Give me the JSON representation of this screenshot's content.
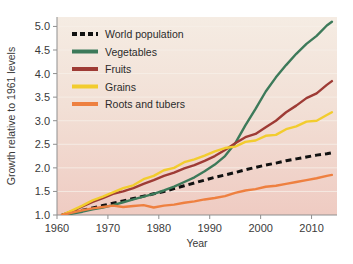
{
  "chart_data": {
    "type": "line",
    "title": "",
    "xlabel": "Year",
    "ylabel": "Growth relative to 1961 levels",
    "xlim": [
      1960,
      2015
    ],
    "ylim": [
      1.0,
      5.2
    ],
    "xticks": [
      1960,
      1970,
      1980,
      1990,
      2000,
      2010
    ],
    "xtick_labels": [
      "1960",
      "1970",
      "1980",
      "1990",
      "2000",
      "2010"
    ],
    "yticks": [
      1.0,
      1.5,
      2.0,
      2.5,
      3.0,
      3.5,
      4.0,
      4.5,
      5.0
    ],
    "ytick_labels": [
      "1.0",
      "1.5",
      "2.0",
      "2.5",
      "3.0",
      "3.5",
      "4.0",
      "4.5",
      "5.0"
    ],
    "grid": true,
    "legend_position": "top-left",
    "x": [
      1961,
      1963,
      1965,
      1967,
      1969,
      1971,
      1973,
      1975,
      1977,
      1979,
      1981,
      1983,
      1985,
      1987,
      1989,
      1991,
      1993,
      1995,
      1997,
      1999,
      2001,
      2003,
      2005,
      2007,
      2009,
      2011,
      2013,
      2014
    ],
    "series": [
      {
        "name": "World population",
        "color": "#111111",
        "style": "dashed",
        "values": [
          1.0,
          1.05,
          1.1,
          1.15,
          1.2,
          1.25,
          1.3,
          1.35,
          1.4,
          1.45,
          1.5,
          1.56,
          1.62,
          1.68,
          1.74,
          1.8,
          1.85,
          1.9,
          1.96,
          2.01,
          2.06,
          2.1,
          2.15,
          2.19,
          2.23,
          2.27,
          2.3,
          2.32
        ]
      },
      {
        "name": "Vegetables",
        "color": "#3d7a5a",
        "style": "solid",
        "values": [
          1.0,
          1.03,
          1.07,
          1.12,
          1.16,
          1.21,
          1.27,
          1.33,
          1.39,
          1.45,
          1.52,
          1.6,
          1.7,
          1.8,
          1.93,
          2.07,
          2.25,
          2.52,
          2.9,
          3.25,
          3.62,
          3.92,
          4.18,
          4.42,
          4.63,
          4.8,
          5.02,
          5.1
        ]
      },
      {
        "name": "Fruits",
        "color": "#9e3b35",
        "style": "solid",
        "values": [
          1.0,
          1.08,
          1.18,
          1.28,
          1.36,
          1.45,
          1.5,
          1.57,
          1.66,
          1.74,
          1.83,
          1.9,
          1.99,
          2.06,
          2.15,
          2.25,
          2.38,
          2.52,
          2.65,
          2.72,
          2.86,
          3.0,
          3.18,
          3.32,
          3.48,
          3.58,
          3.76,
          3.84
        ]
      },
      {
        "name": "Grains",
        "color": "#f2cc2e",
        "style": "solid",
        "values": [
          1.0,
          1.1,
          1.2,
          1.31,
          1.39,
          1.48,
          1.57,
          1.63,
          1.76,
          1.83,
          1.95,
          2.0,
          2.12,
          2.18,
          2.26,
          2.35,
          2.42,
          2.45,
          2.55,
          2.58,
          2.68,
          2.7,
          2.82,
          2.88,
          2.98,
          3.0,
          3.12,
          3.18
        ]
      },
      {
        "name": "Roots and tubers",
        "color": "#ee8040",
        "style": "solid",
        "values": [
          1.0,
          1.05,
          1.1,
          1.14,
          1.17,
          1.2,
          1.17,
          1.19,
          1.21,
          1.16,
          1.2,
          1.22,
          1.26,
          1.29,
          1.33,
          1.36,
          1.4,
          1.47,
          1.52,
          1.55,
          1.6,
          1.62,
          1.66,
          1.7,
          1.74,
          1.78,
          1.83,
          1.85
        ]
      }
    ]
  },
  "legend": {
    "items": [
      {
        "label": "World population",
        "color": "#111111",
        "style": "dashed"
      },
      {
        "label": "Vegetables",
        "color": "#3d7a5a",
        "style": "solid"
      },
      {
        "label": "Fruits",
        "color": "#9e3b35",
        "style": "solid"
      },
      {
        "label": "Grains",
        "color": "#f2cc2e",
        "style": "solid"
      },
      {
        "label": "Roots and tubers",
        "color": "#ee8040",
        "style": "solid"
      }
    ]
  },
  "colors": {
    "plot_background_top": "#f4e9df",
    "plot_background_bottom": "#f0cfc6",
    "axis": "#8f8f8f",
    "gridline": "#f7efe8",
    "tick_text": "#3a3a3a",
    "page_background": "#ffffff"
  }
}
